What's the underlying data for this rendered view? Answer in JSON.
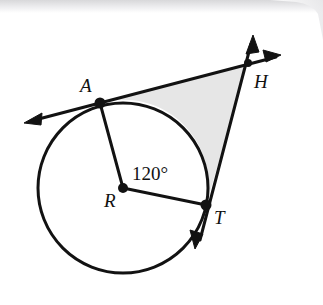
{
  "figure": {
    "background_color": "#ffffff",
    "stroke_color": "#121212",
    "shade_color": "#e6e6e6",
    "scan_edge_color": "#e3e3e5",
    "labels": {
      "point_a": "A",
      "point_h": "H",
      "point_r": "R",
      "point_t": "T",
      "central_angle": "120°"
    },
    "geometry": {
      "circle": {
        "cx": 123,
        "cy": 188,
        "r": 85,
        "stroke_width": 3
      },
      "points": {
        "A": {
          "x": 100,
          "y": 103,
          "dot_r": 5
        },
        "T": {
          "x": 206,
          "y": 205,
          "dot_r": 5
        },
        "H": {
          "x": 248,
          "y": 63,
          "dot_r": 4
        },
        "R": {
          "x": 123,
          "y": 188,
          "dot_r": 5
        }
      },
      "label_positions": {
        "A": {
          "x": 80,
          "y": 92
        },
        "H": {
          "x": 254,
          "y": 88
        },
        "R": {
          "x": 104,
          "y": 207
        },
        "T": {
          "x": 214,
          "y": 224
        },
        "angle": {
          "x": 132,
          "y": 180
        }
      },
      "tangent_line_ah": {
        "from_arrow_tip": {
          "x": 24,
          "y": 123
        },
        "through": "A",
        "to_arrow_tip": {
          "x": 281,
          "y": 56
        }
      },
      "tangent_line_th": {
        "from_arrow_tip": {
          "x": 195,
          "y": 249
        },
        "through": "T",
        "to_arrow_tip": {
          "x": 253,
          "y": 35
        }
      },
      "radii": [
        {
          "from": "R",
          "to": "A"
        },
        {
          "from": "R",
          "to": "T"
        }
      ],
      "shaded_region": {
        "description": "region bounded by segment A-H, segment H-T, and minor arc T-A",
        "fill": "#e6e6e6"
      }
    }
  }
}
